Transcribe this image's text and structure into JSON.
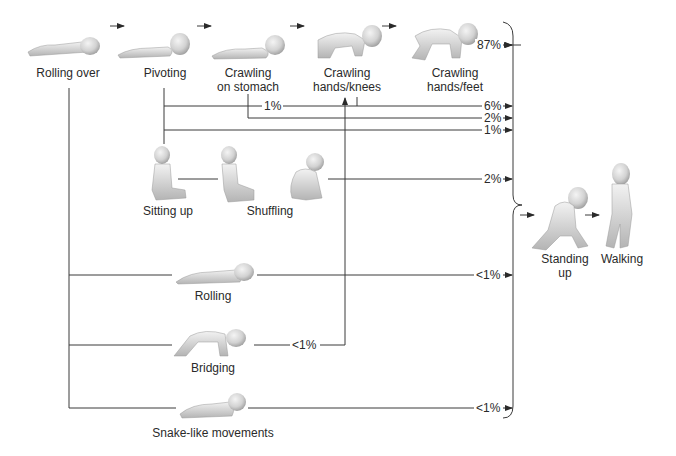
{
  "diagram": {
    "main_sequence": [
      {
        "id": "rolling-over",
        "label": "Rolling over"
      },
      {
        "id": "pivoting",
        "label": "Pivoting"
      },
      {
        "id": "crawling-stomach",
        "label_line1": "Crawling",
        "label_line2": "on stomach"
      },
      {
        "id": "crawling-hands-knees",
        "label_line1": "Crawling",
        "label_line2": "hands/knees"
      },
      {
        "id": "crawling-hands-feet",
        "label_line1": "Crawling",
        "label_line2": "hands/feet"
      }
    ],
    "alternative_stages": {
      "sitting_up": "Sitting up",
      "shuffling": "Shuffling",
      "rolling": "Rolling",
      "bridging": "Bridging",
      "snake_like": "Snake-like movements"
    },
    "final_stages": {
      "standing_up_line1": "Standing",
      "standing_up_line2": "up",
      "walking": "Walking"
    },
    "percentages": {
      "hands_feet_path": "87%",
      "pivot_to_hands_knees_label": "1%",
      "hands_knees_path": "6%",
      "stomach_path": "2%",
      "pivot_direct_path": "1%",
      "shuffling_path": "2%",
      "rolling_path": "<1%",
      "bridging_to_hands_knees": "<1%",
      "snake_path": "<1%"
    },
    "colors": {
      "line": "#3a3a3a",
      "baby_skin_light": "#ececec",
      "baby_skin_shade": "#a8a8a8",
      "text": "#2a2a2a"
    }
  }
}
